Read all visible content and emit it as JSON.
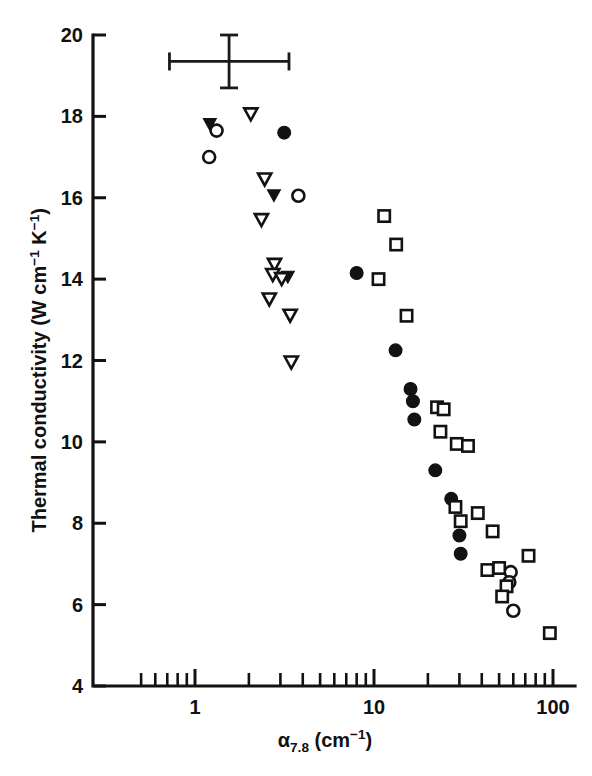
{
  "chart_data": {
    "type": "scatter",
    "title": "",
    "xlabel": "α7.8 (cm−1)",
    "ylabel": "Thermal conductivity (W cm−1 K−1)",
    "xscale": "log",
    "yscale": "linear",
    "xlim": [
      0.45,
      115
    ],
    "ylim": [
      4,
      20
    ],
    "grid": false,
    "legend": "none",
    "x_tick_labels": [
      "1",
      "10",
      "100"
    ],
    "x_tick_values": [
      1,
      10,
      100
    ],
    "y_tick_labels": [
      "4",
      "6",
      "8",
      "10",
      "12",
      "14",
      "16",
      "18",
      "20"
    ],
    "y_tick_values": [
      4,
      6,
      8,
      10,
      12,
      14,
      16,
      18,
      20
    ],
    "error_bar": {
      "x": 1.55,
      "y": 19.35,
      "x_low": 0.72,
      "x_high": 3.35,
      "y_low": 18.7,
      "y_high": 20.0
    },
    "series": [
      {
        "name": "filled-triangle-down",
        "marker": "triangle-down-filled",
        "points": [
          [
            1.21,
            17.8
          ],
          [
            2.76,
            16.05
          ],
          [
            3.3,
            14.05
          ]
        ]
      },
      {
        "name": "open-circle",
        "marker": "circle-open",
        "points": [
          [
            1.32,
            17.65
          ],
          [
            1.2,
            17.0
          ],
          [
            3.78,
            16.05
          ],
          [
            58.0,
            6.8
          ],
          [
            57.0,
            6.55
          ],
          [
            60.0,
            5.85
          ]
        ]
      },
      {
        "name": "open-triangle-down",
        "marker": "triangle-down-open",
        "points": [
          [
            2.05,
            18.05
          ],
          [
            2.45,
            16.45
          ],
          [
            2.35,
            15.45
          ],
          [
            2.78,
            14.35
          ],
          [
            2.72,
            14.1
          ],
          [
            3.05,
            14.0
          ],
          [
            2.6,
            13.5
          ],
          [
            3.4,
            13.1
          ],
          [
            3.45,
            11.95
          ]
        ]
      },
      {
        "name": "filled-circle",
        "marker": "circle-filled",
        "points": [
          [
            3.15,
            17.6
          ],
          [
            8.0,
            14.15
          ],
          [
            13.2,
            12.25
          ],
          [
            16.0,
            11.3
          ],
          [
            16.5,
            11.0
          ],
          [
            16.8,
            10.55
          ],
          [
            22.0,
            9.3
          ],
          [
            27.0,
            8.6
          ],
          [
            30.0,
            7.7
          ],
          [
            30.5,
            7.25
          ]
        ]
      },
      {
        "name": "open-square",
        "marker": "square-open",
        "points": [
          [
            11.4,
            15.55
          ],
          [
            13.3,
            14.85
          ],
          [
            10.6,
            14.0
          ],
          [
            15.2,
            13.1
          ],
          [
            22.5,
            10.85
          ],
          [
            24.5,
            10.8
          ],
          [
            23.5,
            10.25
          ],
          [
            29.0,
            9.95
          ],
          [
            33.5,
            9.9
          ],
          [
            28.5,
            8.4
          ],
          [
            30.5,
            8.05
          ],
          [
            38.0,
            8.25
          ],
          [
            46.0,
            7.8
          ],
          [
            50.0,
            6.9
          ],
          [
            55.0,
            6.45
          ],
          [
            52.0,
            6.2
          ],
          [
            43.0,
            6.85
          ],
          [
            73.0,
            7.2
          ],
          [
            96.0,
            5.3
          ]
        ]
      }
    ]
  },
  "axes": {
    "x_title_base": "α",
    "x_title_sub": "7.8",
    "x_title_unit_pre": " (cm",
    "x_title_unit_sup": "−1",
    "x_title_unit_post": ")",
    "y_title_text_1": "Thermal conductivity (W cm",
    "y_title_sup_1": "−1",
    "y_title_text_2": " K",
    "y_title_sup_2": "−1",
    "y_title_text_3": ")"
  },
  "colors": {
    "ink": "#121212",
    "background": "#ffffff"
  }
}
